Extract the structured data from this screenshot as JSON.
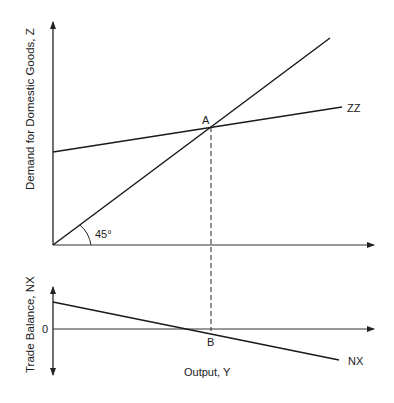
{
  "diagram": {
    "top_panel": {
      "y_axis_label": "Demand for Domestic Goods, Z",
      "angle_label": "45°",
      "lines": [
        {
          "name": "45-degree line",
          "label": ""
        },
        {
          "name": "ZZ",
          "label": "ZZ"
        }
      ],
      "points": [
        {
          "label": "A"
        }
      ]
    },
    "bottom_panel": {
      "y_axis_label": "Trade Balance, NX",
      "zero_label": "0",
      "x_axis_label": "Output, Y",
      "lines": [
        {
          "name": "NX",
          "label": "NX"
        }
      ],
      "points": [
        {
          "label": "B"
        }
      ]
    },
    "colors": {
      "line": "#1a1a1a",
      "axis": "#333333",
      "background": "#ffffff"
    }
  }
}
